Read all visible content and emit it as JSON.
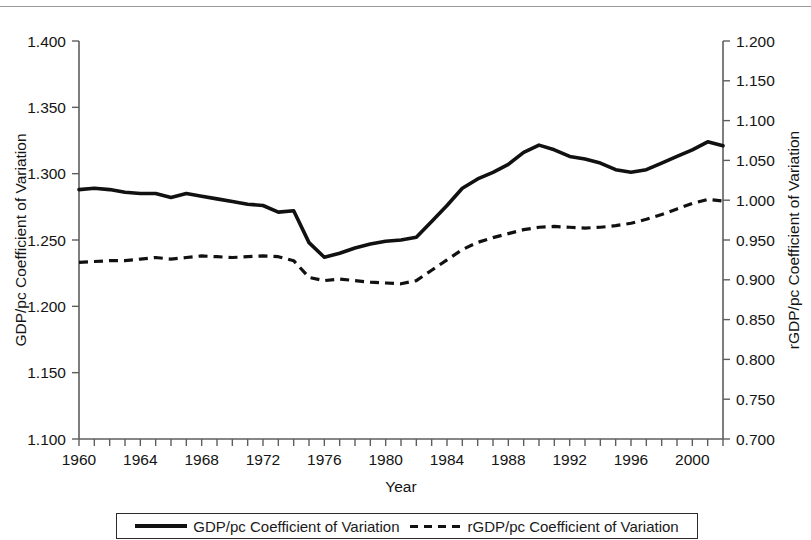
{
  "chart_data": {
    "type": "line",
    "title": "",
    "xlabel": "Year",
    "ylabel": "GDP/pc Coefficient of Variation",
    "ylabel_right": "rGDP/pc Coefficient of Variation",
    "xlim": [
      1960,
      2002
    ],
    "ylim": [
      1.1,
      1.4
    ],
    "ylim_right": [
      0.7,
      1.2
    ],
    "grid": false,
    "legend_position": "bottom",
    "x": [
      1960,
      1961,
      1962,
      1963,
      1964,
      1965,
      1966,
      1967,
      1968,
      1969,
      1970,
      1971,
      1972,
      1973,
      1974,
      1975,
      1976,
      1977,
      1978,
      1979,
      1980,
      1981,
      1982,
      1983,
      1984,
      1985,
      1986,
      1987,
      1988,
      1989,
      1990,
      1991,
      1992,
      1993,
      1994,
      1995,
      1996,
      1997,
      1998,
      1999,
      2000,
      2001,
      2002
    ],
    "xticks": [
      1960,
      1964,
      1968,
      1972,
      1976,
      1980,
      1984,
      1988,
      1992,
      1996,
      2000
    ],
    "xtick_labels": [
      "1960",
      "1964",
      "1968",
      "1972",
      "1976",
      "1980",
      "1984",
      "1988",
      "1992",
      "1996",
      "2000"
    ],
    "yticks": [
      1.1,
      1.15,
      1.2,
      1.25,
      1.3,
      1.35,
      1.4
    ],
    "ytick_labels": [
      "1.100",
      "1.150",
      "1.200",
      "1.250",
      "1.300",
      "1.350",
      "1.400"
    ],
    "yticks_right": [
      0.7,
      0.75,
      0.8,
      0.85,
      0.9,
      0.95,
      1.0,
      1.05,
      1.1,
      1.15,
      1.2
    ],
    "ytick_labels_right": [
      "0.700",
      "0.750",
      "0.800",
      "0.850",
      "0.900",
      "0.950",
      "1.000",
      "1.050",
      "1.100",
      "1.150",
      "1.200"
    ],
    "series": [
      {
        "name": "GDP/pc Coefficient of Variation",
        "axis": "left",
        "style": "solid",
        "color": "#111111",
        "values": [
          1.288,
          1.289,
          1.288,
          1.286,
          1.285,
          1.285,
          1.282,
          1.285,
          1.283,
          1.281,
          1.279,
          1.277,
          1.276,
          1.271,
          1.272,
          1.248,
          1.237,
          1.24,
          1.244,
          1.247,
          1.249,
          1.25,
          1.252,
          1.264,
          1.276,
          1.289,
          1.296,
          1.301,
          1.307,
          1.316,
          1.3215,
          1.318,
          1.313,
          1.311,
          1.308,
          1.303,
          1.301,
          1.303,
          1.308,
          1.313,
          1.318,
          1.324,
          1.321
        ]
      },
      {
        "name": "rGDP/pc Coefficient of Variation",
        "axis": "right",
        "style": "dashed",
        "color": "#111111",
        "values": [
          0.922,
          0.923,
          0.924,
          0.924,
          0.926,
          0.928,
          0.926,
          0.928,
          0.93,
          0.929,
          0.928,
          0.929,
          0.93,
          0.929,
          0.924,
          0.903,
          0.899,
          0.901,
          0.899,
          0.897,
          0.896,
          0.895,
          0.899,
          0.912,
          0.925,
          0.938,
          0.947,
          0.953,
          0.958,
          0.963,
          0.966,
          0.967,
          0.966,
          0.965,
          0.966,
          0.968,
          0.971,
          0.976,
          0.982,
          0.989,
          0.996,
          1.001,
          0.999
        ]
      }
    ]
  },
  "legend": {
    "entries": [
      {
        "label": "GDP/pc Coefficient of Variation",
        "style": "solid"
      },
      {
        "label": "rGDP/pc Coefficient of Variation",
        "style": "dashed"
      }
    ]
  }
}
